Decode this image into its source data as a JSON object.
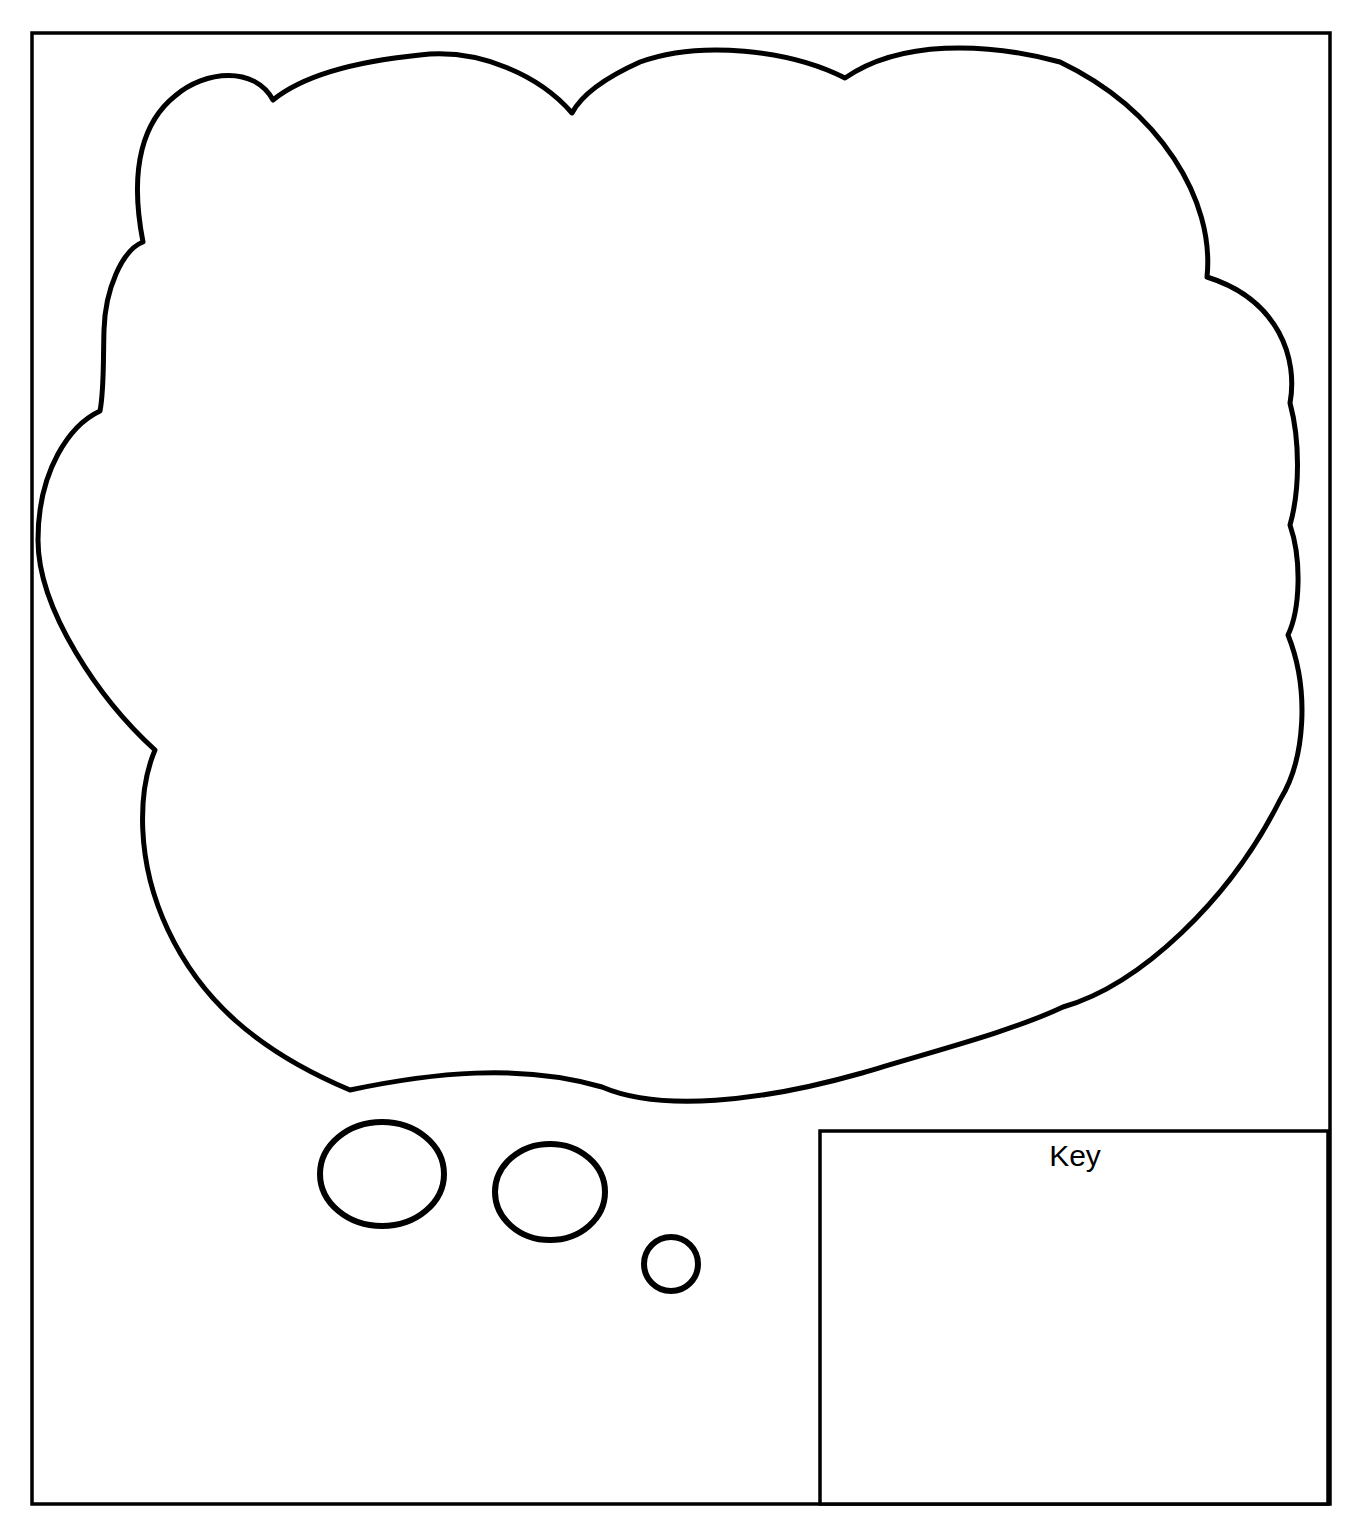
{
  "page": {
    "background_color": "#ffffff",
    "ink_color": "#000000",
    "width": 1355,
    "height": 1525
  },
  "frame": {
    "name": "outer-border",
    "x": 32,
    "y": 33,
    "width": 1298,
    "height": 1471
  },
  "thought_bubble": {
    "name": "thought-cloud",
    "label": "",
    "bounds": {
      "x": 36,
      "y": 46,
      "width": 1274,
      "height": 1055
    },
    "lobe_count": 14
  },
  "tail_bubbles": [
    {
      "name": "tail-bubble-large",
      "cx": 382,
      "cy": 1174,
      "rx": 62,
      "ry": 52
    },
    {
      "name": "tail-bubble-medium",
      "cx": 550,
      "cy": 1192,
      "rx": 55,
      "ry": 48
    },
    {
      "name": "tail-bubble-small",
      "cx": 671,
      "cy": 1264,
      "rx": 27,
      "ry": 27
    }
  ],
  "key_panel": {
    "name": "key-box",
    "title": "Key",
    "x": 820,
    "y": 1131,
    "width": 508,
    "height": 373,
    "content": ""
  }
}
